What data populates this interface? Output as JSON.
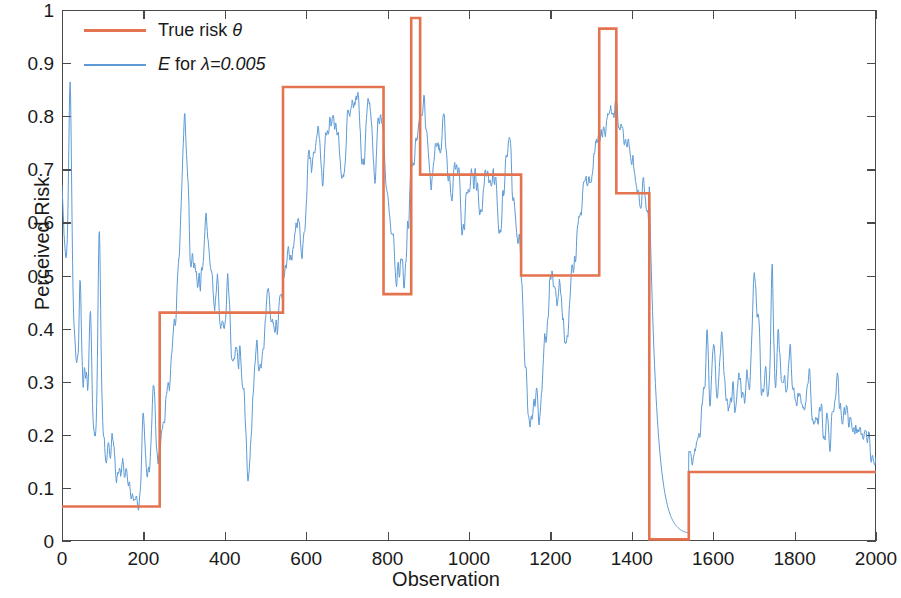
{
  "chart_data": {
    "type": "line",
    "title": "",
    "xlabel": "Observation",
    "ylabel": "Perceived Risk",
    "xlim": [
      0,
      2000
    ],
    "ylim": [
      0,
      1
    ],
    "xticks": [
      0,
      200,
      400,
      600,
      800,
      1000,
      1200,
      1400,
      1600,
      1800,
      2000
    ],
    "yticks": [
      0,
      0.1,
      0.2,
      0.3,
      0.4,
      0.5,
      0.6,
      0.7,
      0.8,
      0.9,
      1
    ],
    "ytick_labels": [
      "0",
      "0.1",
      "0.2",
      "0.3",
      "0.4",
      "0.5",
      "0.6",
      "0.7",
      "0.8",
      "0.9",
      "1"
    ],
    "xtick_labels": [
      "0",
      "200",
      "400",
      "600",
      "800",
      "1000",
      "1200",
      "1400",
      "1600",
      "1800",
      "2000"
    ],
    "grid": false,
    "legend_position": "upper left",
    "colors": {
      "true_risk": "#E4734F",
      "ewma": "#5E9BD6"
    },
    "series": [
      {
        "name": "True risk θ",
        "type": "step",
        "color": "#E4734F",
        "linewidth": 3,
        "segments": [
          {
            "x0": 0,
            "x1": 240,
            "y": 0.065
          },
          {
            "x0": 240,
            "x1": 543,
            "y": 0.43
          },
          {
            "x0": 543,
            "x1": 790,
            "y": 0.855
          },
          {
            "x0": 790,
            "x1": 858,
            "y": 0.465
          },
          {
            "x0": 858,
            "x1": 880,
            "y": 0.985
          },
          {
            "x0": 880,
            "x1": 1128,
            "y": 0.69
          },
          {
            "x0": 1128,
            "x1": 1320,
            "y": 0.5
          },
          {
            "x0": 1320,
            "x1": 1362,
            "y": 0.965
          },
          {
            "x0": 1362,
            "x1": 1443,
            "y": 0.655
          },
          {
            "x0": 1443,
            "x1": 1540,
            "y": 0.003
          },
          {
            "x0": 1540,
            "x1": 2000,
            "y": 0.13
          }
        ]
      },
      {
        "name": "E for λ=0.005",
        "type": "line",
        "color": "#5E9BD6",
        "linewidth": 1,
        "lambda": 0.005,
        "description": "EWMA estimate tracking the true risk with lag and noise",
        "notable_points": [
          {
            "x": 0,
            "y": 0.65,
            "note": "initial value"
          },
          {
            "x": 20,
            "y": 0.33,
            "note": "early spike"
          },
          {
            "x": 90,
            "y": 0.33,
            "note": "spike"
          },
          {
            "x": 185,
            "y": 0.055,
            "note": "trough before step"
          },
          {
            "x": 240,
            "y": 0.17,
            "note": "response begins"
          },
          {
            "x": 300,
            "y": 0.72,
            "note": "overshoot peak"
          },
          {
            "x": 460,
            "y": 0.26,
            "note": "dip"
          },
          {
            "x": 540,
            "y": 0.47,
            "note": "tracking 0.43"
          },
          {
            "x": 620,
            "y": 0.83,
            "note": "tracking 0.855"
          },
          {
            "x": 700,
            "y": 0.83,
            "note": "plateau"
          },
          {
            "x": 790,
            "y": 0.845,
            "note": "before drop"
          },
          {
            "x": 840,
            "y": 0.345,
            "note": "undershoot"
          },
          {
            "x": 872,
            "y": 0.93,
            "note": "spike to true 0.985"
          },
          {
            "x": 960,
            "y": 0.66,
            "note": "tracking 0.69"
          },
          {
            "x": 1110,
            "y": 0.69,
            "note": "peak before drop"
          },
          {
            "x": 1145,
            "y": 0.15,
            "note": "deep undershoot"
          },
          {
            "x": 1250,
            "y": 0.47,
            "note": "tracking 0.50"
          },
          {
            "x": 1335,
            "y": 0.965,
            "note": "peak at spike"
          },
          {
            "x": 1430,
            "y": 0.66,
            "note": "tracking 0.655"
          },
          {
            "x": 1530,
            "y": 0.02,
            "note": "decayed to zero"
          },
          {
            "x": 1590,
            "y": 0.305,
            "note": "spike after rise"
          },
          {
            "x": 1700,
            "y": 0.345,
            "note": "spike"
          },
          {
            "x": 1745,
            "y": 0.37,
            "note": "spike"
          },
          {
            "x": 2000,
            "y": 0.195,
            "note": "final value"
          }
        ]
      }
    ]
  },
  "axes": {
    "xlabel": "Observation",
    "ylabel": "Perceived Risk"
  },
  "legend": {
    "entries": [
      {
        "label_html": "True risk",
        "symbol": "θ",
        "full": "True risk θ",
        "color": "#E4734F",
        "style": "thick"
      },
      {
        "label_html": "E for",
        "symbol": "λ=0.005",
        "full": "E for λ=0.005",
        "color": "#5E9BD6",
        "style": "thin"
      }
    ]
  }
}
